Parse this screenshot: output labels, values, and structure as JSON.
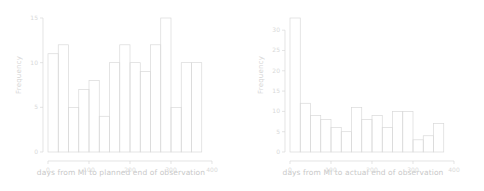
{
  "figure": {
    "background": "#ffffff",
    "line_color": "#d9d9d9",
    "text_color": "#d2d2d2"
  },
  "panels": [
    {
      "id": "left",
      "ylabel": "Frequency",
      "xlabel": "days from MI to planned end of observation",
      "xticks": [
        "0",
        "100",
        "200",
        "300",
        "400"
      ],
      "xtick_values": [
        0,
        100,
        200,
        300,
        400
      ],
      "yticks": [
        "0",
        "5",
        "10",
        "15"
      ],
      "ytick_values": [
        0,
        5,
        10,
        15
      ]
    },
    {
      "id": "right",
      "ylabel": "Frequency",
      "xlabel": "days from MI to actual end of observation",
      "xticks": [
        "0",
        "100",
        "200",
        "300",
        "400"
      ],
      "xtick_values": [
        0,
        100,
        200,
        300,
        400
      ],
      "yticks": [
        "0",
        "5",
        "10",
        "15",
        "20",
        "25",
        "30"
      ],
      "ytick_values": [
        0,
        5,
        10,
        15,
        20,
        25,
        30
      ]
    }
  ],
  "chart_data": [
    {
      "type": "bar",
      "id": "planned-end-histogram",
      "title": "",
      "xlabel": "days from MI to planned end of observation",
      "ylabel": "Frequency",
      "xlim": [
        0,
        400
      ],
      "ylim": [
        0,
        15
      ],
      "grid": false,
      "legend": null,
      "bin_width": 25,
      "bin_edges": [
        0,
        25,
        50,
        75,
        100,
        125,
        150,
        175,
        200,
        225,
        250,
        275,
        300,
        325,
        350,
        375
      ],
      "categories": [
        "0-25",
        "25-50",
        "50-75",
        "75-100",
        "100-125",
        "125-150",
        "150-175",
        "175-200",
        "200-225",
        "225-250",
        "250-275",
        "275-300",
        "300-325",
        "325-350",
        "350-375"
      ],
      "values": [
        11,
        12,
        5,
        7,
        8,
        4,
        10,
        12,
        10,
        9,
        12,
        15,
        5,
        10,
        10
      ]
    },
    {
      "type": "bar",
      "id": "actual-end-histogram",
      "title": "",
      "xlabel": "days from MI to actual end of observation",
      "ylabel": "Frequency",
      "xlim": [
        0,
        400
      ],
      "ylim": [
        0,
        33
      ],
      "grid": false,
      "legend": null,
      "bin_width": 25,
      "bin_edges": [
        0,
        25,
        50,
        75,
        100,
        125,
        150,
        175,
        200,
        225,
        250,
        275,
        300,
        325,
        350,
        375
      ],
      "categories": [
        "0-25",
        "25-50",
        "50-75",
        "75-100",
        "100-125",
        "125-150",
        "150-175",
        "175-200",
        "200-225",
        "225-250",
        "250-275",
        "275-300",
        "300-325",
        "325-350",
        "350-375"
      ],
      "values": [
        33,
        12,
        9,
        8,
        6,
        5,
        11,
        8,
        9,
        6,
        10,
        10,
        3,
        4,
        7
      ]
    }
  ]
}
